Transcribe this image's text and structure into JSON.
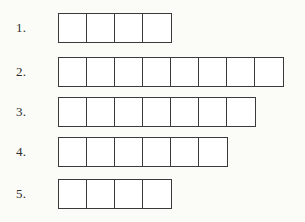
{
  "page": {
    "background_color": "#fbfbf8",
    "line_color": "#3a3a3a",
    "cell_fill_color": "#ffffff"
  },
  "rows": [
    {
      "label": "1.",
      "cell_count": 4,
      "cells": [
        "",
        "",
        "",
        ""
      ]
    },
    {
      "label": "2.",
      "cell_count": 8,
      "cells": [
        "",
        "",
        "",
        "",
        "",
        "",
        "",
        ""
      ]
    },
    {
      "label": "3.",
      "cell_count": 7,
      "cells": [
        "",
        "",
        "",
        "",
        "",
        "",
        ""
      ]
    },
    {
      "label": "4.",
      "cell_count": 6,
      "cells": [
        "",
        "",
        "",
        "",
        "",
        ""
      ]
    },
    {
      "label": "5.",
      "cell_count": 4,
      "cells": [
        "",
        "",
        "",
        ""
      ]
    }
  ],
  "chart_data": {
    "type": "bar",
    "title": "",
    "xlabel": "",
    "ylabel": "",
    "categories": [
      "1.",
      "2.",
      "3.",
      "4.",
      "5."
    ],
    "values": [
      4,
      8,
      7,
      6,
      4
    ],
    "orientation": "horizontal",
    "unit": "cells",
    "grid": false,
    "legend": null,
    "xlim": [
      0,
      8
    ]
  }
}
